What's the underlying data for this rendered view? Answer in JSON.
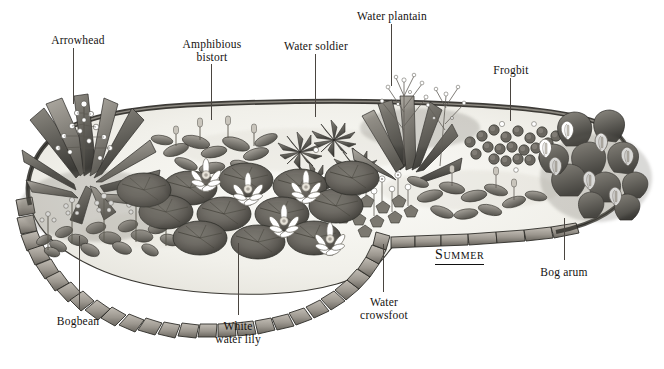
{
  "illustration": {
    "title": "Garden pond planting plan",
    "season_caption": "Summer",
    "palette": {
      "ink": "#14120f",
      "leader": "#4a4540",
      "water": "#f2f1ec",
      "stone_light": "#b9b5ae",
      "stone_mid": "#8d8982",
      "stone_dark": "#4e4b46",
      "foliage_dark": "#3b3a36",
      "foliage_mid": "#6e6c64",
      "foliage_light": "#9d9a92",
      "flower": "#ffffff",
      "background": "#ffffff"
    },
    "labels": [
      {
        "id": "arrowhead",
        "text": "Arrowhead",
        "x": 78,
        "y": 34,
        "leader": {
          "x": 73,
          "y1": 48,
          "y2": 104
        }
      },
      {
        "id": "amphibious-bistort",
        "text": "Amphibious\nbistort",
        "x": 212,
        "y": 38,
        "leader": {
          "x": 211,
          "y1": 64,
          "y2": 120
        }
      },
      {
        "id": "water-soldier",
        "text": "Water soldier",
        "x": 316,
        "y": 40,
        "leader": {
          "x": 315,
          "y1": 54,
          "y2": 117
        }
      },
      {
        "id": "water-plantain",
        "text": "Water plantain",
        "x": 392,
        "y": 10,
        "leader": {
          "x": 391,
          "y1": 24,
          "y2": 86
        }
      },
      {
        "id": "frogbit",
        "text": "Frogbit",
        "x": 511,
        "y": 64,
        "leader": {
          "x": 510,
          "y1": 78,
          "y2": 121
        }
      },
      {
        "id": "bog-arum",
        "text": "Bog arum",
        "x": 564,
        "y": 266,
        "leader": {
          "x": 564,
          "y1": 218,
          "y2": 260
        }
      },
      {
        "id": "water-crowsfoot",
        "text": "Water\ncrowsfoot",
        "x": 384,
        "y": 296,
        "leader": {
          "x": 383,
          "y1": 244,
          "y2": 292
        }
      },
      {
        "id": "white-water-lily",
        "text": "White\nwater lily",
        "x": 238,
        "y": 320,
        "leader": {
          "x": 238,
          "y1": 243,
          "y2": 315
        }
      },
      {
        "id": "bogbean",
        "text": "Bogbean",
        "x": 78,
        "y": 315,
        "leader": {
          "x": 79,
          "y1": 236,
          "y2": 310
        }
      }
    ],
    "plant_groups": [
      {
        "id": "arrowhead",
        "common_name": "Arrowhead",
        "position": "left bank, tall spear-shaped leaves with small white flowers"
      },
      {
        "id": "bogbean",
        "common_name": "Bogbean",
        "position": "front-left shallow margin, fringed white flower spikes"
      },
      {
        "id": "amphibious-bistort",
        "common_name": "Amphibious bistort",
        "position": "back-left water surface, floating oval leaves"
      },
      {
        "id": "water-soldier",
        "common_name": "Water soldier",
        "position": "back-centre, spiky rosettes"
      },
      {
        "id": "water-plantain",
        "common_name": "Water plantain",
        "position": "back-centre-right, branched flower panicles"
      },
      {
        "id": "frogbit",
        "common_name": "Frogbit",
        "position": "back-right, small round floating leaves"
      },
      {
        "id": "bog-arum",
        "common_name": "Bog arum",
        "position": "right bank, white spathes with heart-shaped leaves"
      },
      {
        "id": "water-crowsfoot",
        "common_name": "Water crowsfoot",
        "position": "centre-right water, lobed leaves and white flowers"
      },
      {
        "id": "white-water-lily",
        "common_name": "White water lily",
        "position": "centre pond, round pads with white-pink blooms"
      }
    ]
  }
}
